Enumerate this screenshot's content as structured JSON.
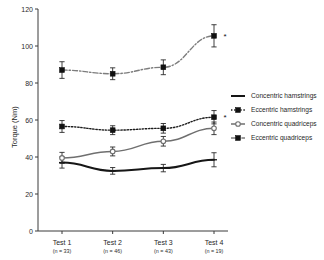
{
  "chart_data": {
    "type": "line",
    "title": "",
    "xlabel": "",
    "ylabel": "Torque (Nm)",
    "ylim": [
      0,
      120
    ],
    "yticks": [
      0,
      20,
      40,
      60,
      80,
      100,
      120
    ],
    "ytick_labels": [
      "0",
      "20",
      "40",
      "60",
      "80",
      "100",
      "120"
    ],
    "grid": false,
    "legend_position": "right",
    "categories": [
      "Test 1",
      "Test 2",
      "Test 3",
      "Test 4"
    ],
    "category_sublabels": [
      "(n = 33)",
      "(n = 46)",
      "(n = 43)",
      "(n = 19)"
    ],
    "series": [
      {
        "name": "Concentric hamstrings",
        "values": [
          37.0,
          32.5,
          34.0,
          38.5
        ],
        "errors": [
          3.0,
          1.8,
          2.0,
          3.8
        ],
        "color": "#161616",
        "line_style": "solid",
        "line_width": 2.0,
        "marker": "plus"
      },
      {
        "name": "Eccentric hamstrings",
        "values": [
          56.5,
          54.5,
          55.5,
          61.5
        ],
        "errors": [
          3.2,
          2.4,
          2.6,
          3.6
        ],
        "color": "#1c1c1c",
        "line_style": "dotted",
        "line_width": 1.4,
        "marker": "square-filled"
      },
      {
        "name": "Concentric quadriceps",
        "values": [
          39.5,
          43.0,
          48.5,
          55.5
        ],
        "errors": [
          3.0,
          2.4,
          2.6,
          3.4
        ],
        "color": "#6f6f6f",
        "line_style": "solid",
        "line_width": 1.5,
        "marker": "circle-open"
      },
      {
        "name": "Eccentric quadriceps",
        "values": [
          87.0,
          85.0,
          88.5,
          105.5
        ],
        "errors": [
          4.5,
          3.2,
          4.0,
          6.0
        ],
        "color": "#7d7d7d",
        "line_style": "dashdot",
        "line_width": 1.4,
        "marker": "square-filled"
      }
    ],
    "annotations": [
      {
        "text": "*",
        "series": "Eccentric quadriceps",
        "category": "Test 4"
      },
      {
        "text": "*",
        "series": "Eccentric hamstrings",
        "category": "Test 4"
      }
    ]
  },
  "legend": {
    "items": [
      {
        "label": "Concentric hamstrings"
      },
      {
        "label": "Eccentric hamstrings"
      },
      {
        "label": "Concentric quadriceps"
      },
      {
        "label": "Eccentric quadriceps"
      }
    ]
  },
  "colors": {
    "axis": "#3a3a3a",
    "background": "#ffffff",
    "text": "#1f1f1f"
  }
}
